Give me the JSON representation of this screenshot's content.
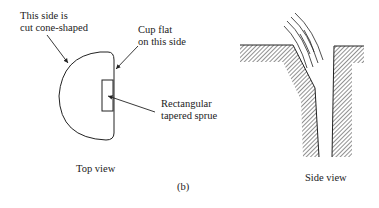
{
  "figure_label": "(b)",
  "top_view": {
    "caption": "Top view",
    "annotations": {
      "cone_side": [
        "This side is",
        "cut cone-shaped"
      ],
      "flat_side": [
        "Cup flat",
        "on this side"
      ],
      "sprue": [
        "Rectangular",
        "tapered sprue"
      ]
    }
  },
  "side_view": {
    "caption": "Side view"
  },
  "colors": {
    "ink": "#222222",
    "hatch": "#555555",
    "background": "#ffffff"
  }
}
